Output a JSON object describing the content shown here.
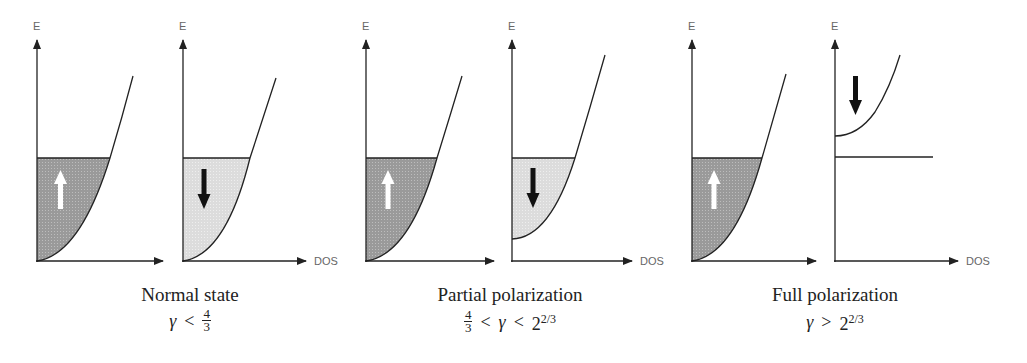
{
  "axes": {
    "y_label": "E",
    "x_label": "DOS"
  },
  "colors": {
    "spin_up_fill": "#9a9a9a",
    "spin_down_fill": "#dcdcdc",
    "line": "#222222",
    "up_arrow": "#ffffff",
    "down_arrow": "#111111"
  },
  "panels": [
    {
      "title": "Normal state",
      "condition": {
        "left": "γ",
        "op": "<",
        "right_frac": {
          "num": "4",
          "den": "3"
        }
      },
      "spin_up": {
        "arrow": "up",
        "filled": true,
        "band_bottom": "0"
      },
      "spin_down": {
        "arrow": "down",
        "filled": true,
        "band_bottom": "0"
      }
    },
    {
      "title": "Partial polarization",
      "condition": {
        "left_frac": {
          "num": "4",
          "den": "3"
        },
        "op1": "<",
        "middle": "γ",
        "op2": "<",
        "right_base": "2",
        "right_exp": "2/3"
      },
      "spin_up": {
        "arrow": "up",
        "filled": true,
        "band_bottom": "0"
      },
      "spin_down": {
        "arrow": "down",
        "filled": true,
        "band_bottom": "shifted up"
      }
    },
    {
      "title": "Full polarization",
      "condition": {
        "left": "γ",
        "op": ">",
        "right_base": "2",
        "right_exp": "2/3"
      },
      "spin_up": {
        "arrow": "up",
        "filled": true,
        "band_bottom": "0"
      },
      "spin_down": {
        "arrow": "down",
        "filled": false,
        "band_bottom": "above Fermi level"
      }
    }
  ]
}
